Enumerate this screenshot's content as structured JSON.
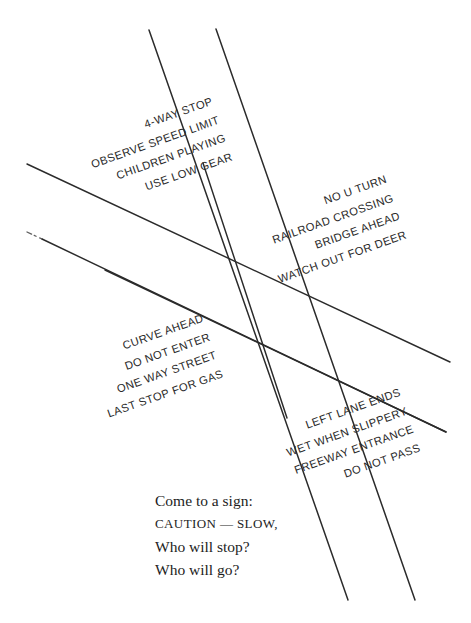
{
  "page": {
    "title": "Come to a sign",
    "background_color": "#ffffff",
    "ink_color": "#2a2a2a",
    "width": 471,
    "height": 623
  },
  "sign_groups": [
    {
      "name": "four-way-stop-group",
      "rotation_deg": -19.5,
      "lines": [
        "4-WAY STOP",
        "OBSERVE SPEED LIMIT",
        "CHILDREN PLAYING",
        "USE LOW GEAR"
      ]
    },
    {
      "name": "hazard-group",
      "rotation_deg": -19.5,
      "lines": [
        "NO U TURN",
        "RAILROAD CROSSING",
        "BRIDGE AHEAD",
        "WATCH OUT FOR DEER"
      ]
    },
    {
      "name": "curve-group",
      "rotation_deg": -19.5,
      "lines": [
        "CURVE AHEAD",
        "DO NOT ENTER",
        "ONE WAY STREET",
        "LAST STOP FOR GAS"
      ]
    },
    {
      "name": "lane-group",
      "rotation_deg": -19.5,
      "lines": [
        "LEFT LANE ENDS",
        "WET WHEN SLIPPERY",
        "FREEWAY ENTRANCE",
        "DO NOT PASS"
      ]
    }
  ],
  "poem": {
    "lines": [
      "Come to a sign:",
      "CAUTION — SLOW,",
      "Who will stop?",
      "Who will go?"
    ]
  },
  "road_lines": [
    {
      "name": "steep-road-line-1",
      "x1": 149,
      "y1": 30,
      "x2": 348,
      "y2": 600,
      "width": 1.4,
      "opacity": 1
    },
    {
      "name": "steep-road-line-2",
      "x1": 216,
      "y1": 29,
      "x2": 415,
      "y2": 600,
      "width": 1.4,
      "opacity": 1
    },
    {
      "name": "steep-road-line-3",
      "x1": 203,
      "y1": 163,
      "x2": 287,
      "y2": 418,
      "width": 1.4,
      "opacity": 1
    },
    {
      "name": "shallow-road-line-1",
      "x1": 27,
      "y1": 164,
      "x2": 450,
      "y2": 362,
      "width": 1.4,
      "opacity": 1
    },
    {
      "name": "shallow-road-line-2",
      "x1": 27,
      "y1": 232,
      "x2": 446,
      "y2": 432,
      "width": 1.4,
      "opacity": 1
    },
    {
      "name": "shallow-road-line-3",
      "x1": 105,
      "y1": 270,
      "x2": 446,
      "y2": 432,
      "width": 1.4,
      "opacity": 1
    }
  ]
}
